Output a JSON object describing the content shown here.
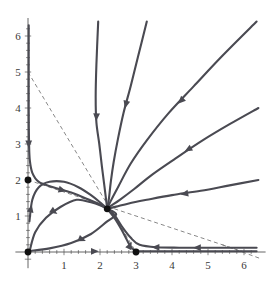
{
  "figure": {
    "type": "phase-portrait",
    "title": "",
    "background_color": "#ffffff",
    "trajectory_color": "#4a4a52",
    "nullcline_color": "#6a6a6a",
    "axis_color": "#555555",
    "equilibrium_color": "#111111"
  },
  "axes": {
    "x": {
      "label": "",
      "min": -0.35,
      "max": 6.6,
      "ticks_major": [
        1,
        2,
        3,
        4,
        5,
        6
      ],
      "tick_labels": [
        "1",
        "2",
        "3",
        "4",
        "5",
        "6"
      ],
      "minor_tick_step": 0.2,
      "origin_px": 28,
      "scale_px_per_unit": 36
    },
    "y": {
      "label": "",
      "min": -0.45,
      "max": 6.5,
      "ticks_major": [
        1,
        2,
        3,
        4,
        5,
        6
      ],
      "tick_labels": [
        "1",
        "2",
        "3",
        "4",
        "5",
        "6"
      ],
      "minor_tick_step": 0.2,
      "origin_px": 252,
      "scale_px_per_unit": 36
    }
  },
  "chart_data": {
    "type": "line",
    "title": "",
    "xlabel": "",
    "ylabel": "",
    "xlim": [
      -0.35,
      6.6
    ],
    "ylim": [
      -0.45,
      6.5
    ],
    "grid": false,
    "legend": "none",
    "equilibria": [
      {
        "name": "origin",
        "x": 0,
        "y": 0,
        "kind": "unstable-node"
      },
      {
        "name": "y-axis-equilibrium",
        "x": 0,
        "y": 2,
        "kind": "saddle"
      },
      {
        "name": "x-axis-equilibrium",
        "x": 3,
        "y": 0,
        "kind": "saddle"
      },
      {
        "name": "interior-equilibrium",
        "x": 2.2,
        "y": 1.2,
        "kind": "stable-node"
      }
    ],
    "nullclines": [
      {
        "name": "nullcline-steep",
        "style": "dashed",
        "points": [
          [
            0,
            5
          ],
          [
            3,
            0
          ]
        ]
      },
      {
        "name": "nullcline-shallow",
        "style": "dashed",
        "points": [
          [
            0,
            2
          ],
          [
            6,
            0
          ]
        ]
      }
    ],
    "trajectories": [
      {
        "name": "trajectory-y-axis-down",
        "arrow_direction": "toward-equilibrium",
        "points": [
          [
            0.02,
            6.3
          ],
          [
            0.02,
            4.0
          ],
          [
            0.03,
            3.0
          ],
          [
            0.05,
            2.55
          ],
          [
            0.12,
            2.2
          ],
          [
            0.3,
            1.95
          ],
          [
            0.7,
            1.8
          ],
          [
            1.2,
            1.65
          ],
          [
            1.7,
            1.45
          ],
          [
            2.0,
            1.32
          ],
          [
            2.2,
            1.2
          ]
        ]
      },
      {
        "name": "trajectory-from-top-left",
        "arrow_direction": "toward-equilibrium",
        "points": [
          [
            1.95,
            6.4
          ],
          [
            1.9,
            5.2
          ],
          [
            1.88,
            4.3
          ],
          [
            1.9,
            3.6
          ],
          [
            1.98,
            3.0
          ],
          [
            2.05,
            2.4
          ],
          [
            2.12,
            1.85
          ],
          [
            2.17,
            1.45
          ],
          [
            2.2,
            1.2
          ]
        ]
      },
      {
        "name": "trajectory-from-top-center",
        "arrow_direction": "toward-equilibrium",
        "points": [
          [
            3.3,
            6.4
          ],
          [
            3.05,
            5.4
          ],
          [
            2.85,
            4.6
          ],
          [
            2.65,
            3.85
          ],
          [
            2.5,
            3.15
          ],
          [
            2.38,
            2.5
          ],
          [
            2.3,
            1.95
          ],
          [
            2.25,
            1.5
          ],
          [
            2.2,
            1.2
          ]
        ]
      },
      {
        "name": "trajectory-from-upper-right-1",
        "arrow_direction": "toward-equilibrium",
        "points": [
          [
            6.35,
            6.4
          ],
          [
            5.4,
            5.45
          ],
          [
            4.6,
            4.6
          ],
          [
            3.9,
            3.85
          ],
          [
            3.3,
            3.1
          ],
          [
            2.85,
            2.45
          ],
          [
            2.5,
            1.8
          ],
          [
            2.3,
            1.42
          ],
          [
            2.2,
            1.2
          ]
        ]
      },
      {
        "name": "trajectory-from-upper-right-2",
        "arrow_direction": "toward-equilibrium",
        "points": [
          [
            6.4,
            4.0
          ],
          [
            5.6,
            3.55
          ],
          [
            4.85,
            3.1
          ],
          [
            4.1,
            2.6
          ],
          [
            3.45,
            2.15
          ],
          [
            2.95,
            1.75
          ],
          [
            2.55,
            1.45
          ],
          [
            2.3,
            1.28
          ],
          [
            2.2,
            1.2
          ]
        ]
      },
      {
        "name": "trajectory-from-right",
        "arrow_direction": "toward-equilibrium",
        "points": [
          [
            6.4,
            2.0
          ],
          [
            5.6,
            1.85
          ],
          [
            4.8,
            1.7
          ],
          [
            4.0,
            1.58
          ],
          [
            3.3,
            1.45
          ],
          [
            2.8,
            1.35
          ],
          [
            2.45,
            1.26
          ],
          [
            2.2,
            1.2
          ]
        ]
      },
      {
        "name": "trajectory-from-origin-upper",
        "arrow_direction": "toward-equilibrium",
        "points": [
          [
            0.04,
            0.85
          ],
          [
            0.12,
            1.45
          ],
          [
            0.3,
            1.8
          ],
          [
            0.6,
            1.95
          ],
          [
            1.0,
            1.95
          ],
          [
            1.4,
            1.8
          ],
          [
            1.75,
            1.58
          ],
          [
            2.0,
            1.38
          ],
          [
            2.2,
            1.2
          ]
        ]
      },
      {
        "name": "trajectory-from-origin-mid",
        "arrow_direction": "toward-equilibrium",
        "points": [
          [
            0.05,
            0.05
          ],
          [
            0.2,
            0.55
          ],
          [
            0.5,
            0.95
          ],
          [
            0.9,
            1.25
          ],
          [
            1.35,
            1.45
          ],
          [
            1.75,
            1.38
          ],
          [
            2.0,
            1.3
          ],
          [
            2.2,
            1.2
          ]
        ]
      },
      {
        "name": "trajectory-from-origin-lower",
        "arrow_direction": "toward-equilibrium",
        "points": [
          [
            0.06,
            0.03
          ],
          [
            0.6,
            0.1
          ],
          [
            1.2,
            0.25
          ],
          [
            1.75,
            0.5
          ],
          [
            2.2,
            0.85
          ],
          [
            2.45,
            1.05
          ],
          [
            2.2,
            1.2
          ]
        ]
      },
      {
        "name": "trajectory-down-to-x-axis",
        "arrow_direction": "away-from-equilibrium",
        "points": [
          [
            2.2,
            1.2
          ],
          [
            2.4,
            0.95
          ],
          [
            2.6,
            0.62
          ],
          [
            2.75,
            0.33
          ],
          [
            2.85,
            0.15
          ],
          [
            2.95,
            0.05
          ],
          [
            3.0,
            0.02
          ]
        ]
      },
      {
        "name": "trajectory-right-along-x-axis",
        "arrow_direction": "toward-equilibrium",
        "points": [
          [
            6.35,
            0.12
          ],
          [
            5.6,
            0.12
          ],
          [
            4.9,
            0.12
          ],
          [
            4.2,
            0.12
          ],
          [
            3.6,
            0.13
          ],
          [
            3.1,
            0.2
          ],
          [
            2.85,
            0.4
          ],
          [
            2.6,
            0.72
          ],
          [
            2.42,
            1.0
          ],
          [
            2.3,
            1.12
          ],
          [
            2.2,
            1.2
          ]
        ]
      },
      {
        "name": "trajectory-x-axis-base",
        "arrow_direction": "toward-x-equilibrium",
        "points": [
          [
            6.35,
            0.02
          ],
          [
            5.0,
            0.02
          ],
          [
            4.0,
            0.02
          ],
          [
            3.3,
            0.02
          ],
          [
            3.0,
            0.02
          ]
        ]
      }
    ],
    "arrow_markers": [
      {
        "trajectory": "trajectory-y-axis-down",
        "x": 0.02,
        "y": 3.0,
        "angle_deg": 90
      },
      {
        "trajectory": "trajectory-y-axis-down",
        "x": 0.95,
        "y": 1.72,
        "angle_deg": 15
      },
      {
        "trajectory": "trajectory-from-top-left",
        "x": 1.9,
        "y": 3.75,
        "angle_deg": 93
      },
      {
        "trajectory": "trajectory-from-top-center",
        "x": 2.72,
        "y": 4.1,
        "angle_deg": 105
      },
      {
        "trajectory": "trajectory-from-upper-right-1",
        "x": 4.25,
        "y": 4.2,
        "angle_deg": 135
      },
      {
        "trajectory": "trajectory-from-upper-right-2",
        "x": 4.45,
        "y": 2.85,
        "angle_deg": 150
      },
      {
        "trajectory": "trajectory-from-right",
        "x": 4.35,
        "y": 1.62,
        "angle_deg": 170
      },
      {
        "trajectory": "trajectory-from-origin-upper",
        "x": 0.08,
        "y": 1.2,
        "angle_deg": -78
      },
      {
        "trajectory": "trajectory-from-origin-mid",
        "x": 0.72,
        "y": 1.12,
        "angle_deg": 35
      },
      {
        "trajectory": "trajectory-from-origin-lower",
        "x": 1.5,
        "y": 0.35,
        "angle_deg": 22
      },
      {
        "trajectory": "trajectory-down-to-x-axis",
        "x": 2.83,
        "y": 0.18,
        "angle_deg": -65
      },
      {
        "trajectory": "trajectory-right-along-x-axis",
        "x": 4.7,
        "y": 0.12,
        "angle_deg": 180
      },
      {
        "trajectory": "trajectory-right-along-x-axis",
        "x": 3.55,
        "y": 0.13,
        "angle_deg": 180
      },
      {
        "trajectory": "trajectory-x-axis-base",
        "x": 1.85,
        "y": 0.02,
        "angle_deg": 0
      }
    ]
  }
}
